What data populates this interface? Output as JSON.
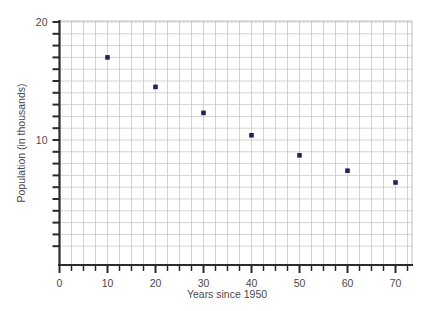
{
  "chart_data": {
    "type": "scatter",
    "title": "",
    "xlabel": "Years since 1950",
    "ylabel": "Population (in thousands)",
    "x": [
      10,
      20,
      30,
      40,
      50,
      60,
      70
    ],
    "values": [
      17.0,
      14.5,
      12.3,
      10.4,
      8.7,
      7.4,
      6.4
    ],
    "series": [
      {
        "name": "Population",
        "points": [
          {
            "x": 10,
            "y": 17.0
          },
          {
            "x": 20,
            "y": 14.5
          },
          {
            "x": 30,
            "y": 12.3
          },
          {
            "x": 40,
            "y": 10.4
          },
          {
            "x": 50,
            "y": 8.7
          },
          {
            "x": 60,
            "y": 7.4
          },
          {
            "x": 70,
            "y": 6.4
          }
        ]
      }
    ],
    "xlim": [
      0,
      75
    ],
    "ylim": [
      0.5,
      20
    ],
    "xticks": [
      0,
      10,
      20,
      30,
      40,
      50,
      60,
      70
    ],
    "xtick_labels": [
      "0",
      "10",
      "20",
      "30",
      "40",
      "50",
      "60",
      "70"
    ],
    "yticks": [
      10,
      20
    ],
    "ytick_labels": [
      "10",
      "20"
    ],
    "y_minor_step": 1,
    "x_minor_step": 2.5,
    "grid": true,
    "legend": "none",
    "marker_color": "#1b2a55",
    "grid_color": "#b8b8b8",
    "axis_color": "#2b2b2b"
  },
  "axis": {
    "x_label": "Years since 1950",
    "y_label": "Population (in thousands)",
    "x_ticks": [
      "0",
      "10",
      "20",
      "30",
      "40",
      "50",
      "60",
      "70"
    ],
    "y_ticks": [
      "20",
      "10"
    ]
  }
}
